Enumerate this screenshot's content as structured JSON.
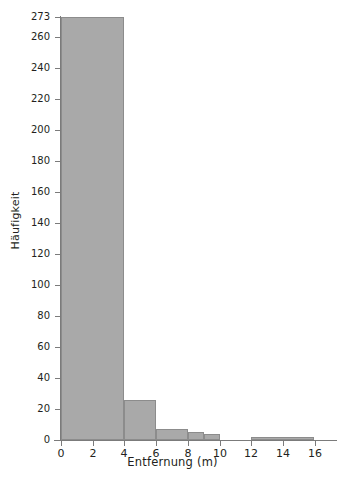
{
  "chart_data": {
    "type": "bar",
    "title": "",
    "xlabel": "Entfernung (m)",
    "ylabel": "Häufigkeit",
    "grid": false,
    "legend": "none",
    "xlim": [
      0,
      17.2
    ],
    "ylim": [
      0,
      273
    ],
    "xticks": [
      0,
      2,
      4,
      6,
      8,
      10,
      12,
      14,
      16
    ],
    "xtick_labels": [
      "0",
      "2",
      "4",
      "6",
      "8",
      "10",
      "12",
      "14",
      "16"
    ],
    "yticks": [
      0,
      20,
      40,
      60,
      80,
      100,
      120,
      140,
      160,
      180,
      200,
      220,
      240,
      260,
      273
    ],
    "ytick_labels": [
      "0",
      "20",
      "40",
      "60",
      "80",
      "100",
      "120",
      "140",
      "160",
      "180",
      "200",
      "220",
      "240",
      "260",
      "273"
    ],
    "bins": [
      {
        "label": "0-4",
        "x0": 0,
        "x1": 4,
        "value": 273
      },
      {
        "label": "4-6",
        "x0": 4,
        "x1": 6,
        "value": 26
      },
      {
        "label": "6-8",
        "x0": 6,
        "x1": 8,
        "value": 7
      },
      {
        "label": "8-9",
        "x0": 8,
        "x1": 9,
        "value": 5
      },
      {
        "label": "9-10",
        "x0": 9,
        "x1": 10,
        "value": 4
      },
      {
        "label": "12-16",
        "x0": 12,
        "x1": 16,
        "value": 2
      }
    ],
    "categories": [
      "0-4",
      "4-6",
      "6-8",
      "8-9",
      "9-10",
      "12-16"
    ],
    "values": [
      273,
      26,
      7,
      5,
      4,
      2
    ],
    "colors": {
      "bar_fill": "#a9a9a9",
      "bar_stroke": "#8c8c8c",
      "axis": "#7b7b7b",
      "text": "#231f20",
      "background": "#ffffff"
    }
  }
}
